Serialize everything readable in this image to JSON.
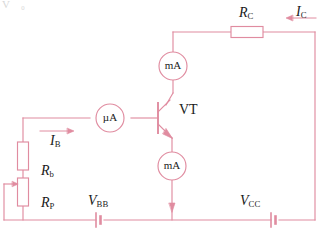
{
  "figure": {
    "type": "circuit-schematic",
    "wire_color": "#e08ca0",
    "component_color": "#e08ca0",
    "label_color": "#1a1a1a",
    "background": "#ffffff"
  },
  "corner_note": {
    "text": "V ₀"
  },
  "components": {
    "transistor": {
      "label": "VT",
      "type": "npn"
    },
    "resistor_collector": {
      "label_main": "R",
      "label_sub": "C",
      "name": "collector-resistor"
    },
    "resistor_base": {
      "label_main": "R",
      "label_sub": "b",
      "name": "base-resistor"
    },
    "potentiometer": {
      "label_main": "R",
      "label_sub": "P",
      "name": "base-potentiometer"
    },
    "battery_base": {
      "label_main": "V",
      "label_sub": "BB",
      "name": "base-supply"
    },
    "battery_collector": {
      "label_main": "V",
      "label_sub": "CC",
      "name": "collector-supply"
    },
    "meter_collector": {
      "label": "mA",
      "name": "collector-milliammeter"
    },
    "meter_emitter": {
      "label": "mA",
      "name": "emitter-milliammeter"
    },
    "meter_base": {
      "label": "µA",
      "name": "base-microammeter"
    }
  },
  "currents": {
    "base": {
      "label_main": "I",
      "label_sub": "B",
      "direction": "right"
    },
    "collector": {
      "label_main": "I",
      "label_sub": "C",
      "direction": "left"
    }
  }
}
